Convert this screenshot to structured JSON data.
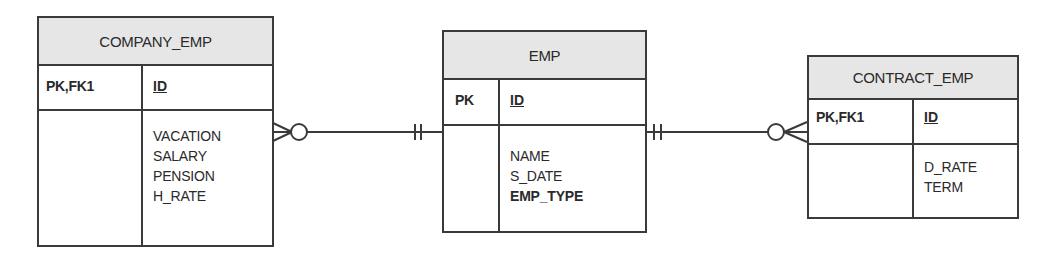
{
  "entities": {
    "company_emp": {
      "name": "COMPANY_EMP",
      "key_label": "PK,FK1",
      "pk_attribute": "ID",
      "attributes": [
        "VACATION",
        "SALARY",
        "PENSION",
        "H_RATE"
      ]
    },
    "emp": {
      "name": "EMP",
      "key_label": "PK",
      "pk_attribute": "ID",
      "attributes": [
        "NAME",
        "S_DATE",
        "EMP_TYPE"
      ],
      "bold_attributes": [
        "EMP_TYPE"
      ]
    },
    "contract_emp": {
      "name": "CONTRACT_EMP",
      "key_label": "PK,FK1",
      "pk_attribute": "ID",
      "attributes": [
        "D_RATE",
        "TERM"
      ]
    }
  },
  "relationships": [
    {
      "from": "EMP",
      "to": "COMPANY_EMP",
      "from_cardinality": "exactly-one",
      "to_cardinality": "zero-or-many"
    },
    {
      "from": "EMP",
      "to": "CONTRACT_EMP",
      "from_cardinality": "exactly-one",
      "to_cardinality": "zero-or-many"
    }
  ],
  "colors": {
    "line": "#3a3a3a",
    "header_fill": "#e6e6e6",
    "text": "#2a2a2a"
  }
}
